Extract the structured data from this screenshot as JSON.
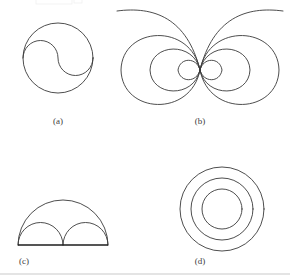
{
  "figure": {
    "name": "four-panel-geometric-figure-plate",
    "background_color": "#ffffff",
    "stroke_color": "#3a3a3a",
    "baseline_color": "#1c1c1c",
    "rule_color": "#c9c9c9",
    "width": 290,
    "height": 280
  },
  "panels": [
    {
      "id": "a",
      "caption": "(a)",
      "caption_x": 58,
      "caption_y": 124,
      "description": "circle with interior S-curve of two semicircles (yin-yang outline)",
      "circle": {
        "cx": 58,
        "cy": 58,
        "r": 35
      },
      "s_curve_semicircle_r": 17.5
    },
    {
      "id": "b",
      "caption": "(b)",
      "caption_x": 200,
      "caption_y": 124,
      "description": "magnetic dipole field lines: nested loops left and right of a central point with outer open curves sweeping upward",
      "center": {
        "cx": 200,
        "cy": 70
      },
      "loop_half_widths": [
        11,
        25,
        41
      ],
      "loop_half_heights": [
        9,
        21,
        35
      ],
      "open_curve_span": 68
    },
    {
      "id": "c",
      "caption": "(c)",
      "caption_x": 24,
      "caption_y": 264,
      "description": "arbelos: one large semicircle above a baseline containing two equal smaller semicircles",
      "baseline": {
        "x1": 18,
        "x2": 108,
        "y": 245
      },
      "large_semicircle_r": 45,
      "small_semicircle_r": 22.5
    },
    {
      "id": "d",
      "caption": "(d)",
      "caption_x": 200,
      "caption_y": 264,
      "description": "three concentric circles (annuli)",
      "center": {
        "cx": 222,
        "cy": 209
      },
      "radii": [
        42,
        31,
        20
      ]
    }
  ],
  "page_rule": {
    "x1": 0,
    "x2": 290,
    "y": 274
  },
  "captions": {
    "a": "(a)",
    "b": "(b)",
    "c": "(c)",
    "d": "(d)"
  }
}
